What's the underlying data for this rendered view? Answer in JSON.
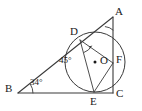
{
  "figure": {
    "kind": "geometry-diagram",
    "stroke_color": "#3a3a3a",
    "label_color": "#1a1a1a",
    "background_color": "#ffffff"
  },
  "vertices": {
    "A": {
      "label": "A",
      "x": 113,
      "y": 17
    },
    "B": {
      "label": "B",
      "x": 18,
      "y": 93
    },
    "C": {
      "label": "C",
      "x": 113,
      "y": 93
    },
    "D": {
      "label": "D",
      "x": 80,
      "y": 40
    },
    "E": {
      "label": "E",
      "x": 94,
      "y": 92
    },
    "F": {
      "label": "F",
      "x": 113,
      "y": 63
    },
    "O": {
      "label": "O",
      "x": 95,
      "y": 62
    }
  },
  "circle": {
    "center_x": 95,
    "center_y": 62,
    "radius": 30,
    "center_dot_label": "•"
  },
  "angles": {
    "at_D": {
      "value": "45",
      "degree_symbol": "°",
      "text": "45°"
    },
    "at_B": {
      "value": "34",
      "degree_symbol": "°",
      "text": "34°"
    },
    "at_A": {
      "value": "",
      "degree_symbol": "",
      "text": ""
    }
  },
  "segments": [
    {
      "name": "AB",
      "from": "A",
      "to": "B"
    },
    {
      "name": "BC",
      "from": "B",
      "to": "C"
    },
    {
      "name": "CA",
      "from": "C",
      "to": "A"
    },
    {
      "name": "DE",
      "from": "D",
      "to": "E"
    },
    {
      "name": "DF",
      "from": "D",
      "to": "F"
    },
    {
      "name": "EF",
      "from": "E",
      "to": "F"
    }
  ]
}
